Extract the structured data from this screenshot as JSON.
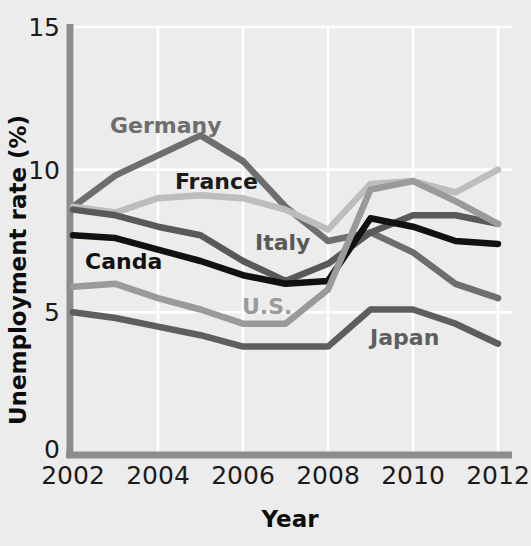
{
  "chart_data": {
    "type": "line",
    "title": "",
    "xlabel": "Year",
    "ylabel": "Unemployment rate (%)",
    "xlim": [
      2002,
      2012
    ],
    "ylim": [
      0,
      15
    ],
    "ytick_labels": [
      "0",
      "5",
      "10",
      "15"
    ],
    "yticks": [
      0,
      5,
      10,
      15
    ],
    "xtick_labels": [
      "2002",
      "2004",
      "2006",
      "2008",
      "2010",
      "2012"
    ],
    "xticks": [
      2002,
      2004,
      2006,
      2008,
      2010,
      2012
    ],
    "grid": true,
    "grid_color": "#ffffff",
    "legend_position": "inline-labels",
    "background": "#ececec",
    "axis_color": "#8c8c8c",
    "x": [
      2002,
      2003,
      2004,
      2005,
      2006,
      2007,
      2008,
      2009,
      2010,
      2011,
      2012
    ],
    "series": [
      {
        "name": "Germany",
        "color": "#6e6e6e",
        "label_x": 110,
        "label_y": 133,
        "values": [
          8.7,
          9.8,
          10.5,
          11.2,
          10.3,
          8.7,
          7.5,
          7.8,
          7.1,
          6.0,
          5.5
        ]
      },
      {
        "name": "France",
        "color": "#bdbdbd",
        "label_x": 175,
        "label_y": 189,
        "values": [
          8.7,
          8.5,
          9.0,
          9.1,
          9.0,
          8.6,
          7.9,
          9.5,
          9.6,
          9.2,
          10.0
        ]
      },
      {
        "name": "Italy",
        "color": "#595959",
        "label_x": 255,
        "label_y": 250,
        "values": [
          8.6,
          8.4,
          8.0,
          7.7,
          6.8,
          6.1,
          6.7,
          7.8,
          8.4,
          8.4,
          8.1
        ]
      },
      {
        "name": "Canda",
        "color": "#111111",
        "label_x": 85,
        "label_y": 269,
        "values": [
          7.7,
          7.6,
          7.2,
          6.8,
          6.3,
          6.0,
          6.1,
          8.3,
          8.0,
          7.5,
          7.4
        ]
      },
      {
        "name": "U.S.",
        "color": "#9a9a9a",
        "label_x": 242,
        "label_y": 314,
        "values": [
          5.9,
          6.0,
          5.5,
          5.1,
          4.6,
          4.6,
          5.8,
          9.3,
          9.6,
          8.9,
          8.1
        ]
      },
      {
        "name": "Japan",
        "color": "#5e5e5e",
        "label_x": 370,
        "label_y": 345,
        "values": [
          5.0,
          4.8,
          4.5,
          4.2,
          3.8,
          3.8,
          3.8,
          5.1,
          5.1,
          4.6,
          3.9
        ]
      }
    ]
  },
  "axes": {
    "ylabel": "Unemployment rate (%)",
    "xlabel": "Year"
  }
}
